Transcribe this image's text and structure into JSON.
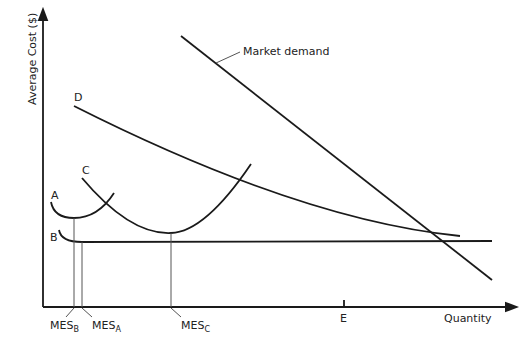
{
  "diagram": {
    "y_axis_label": "Average Cost ($)",
    "x_axis_label": "Quantity",
    "curves": {
      "A": "A",
      "B": "B",
      "C": "C",
      "D": "D",
      "demand": "Market demand"
    },
    "x_markers": {
      "mes_b": {
        "main": "MES",
        "sub": "B"
      },
      "mes_a": {
        "main": "MES",
        "sub": "A"
      },
      "mes_c": {
        "main": "MES",
        "sub": "C"
      },
      "e": "E"
    }
  }
}
